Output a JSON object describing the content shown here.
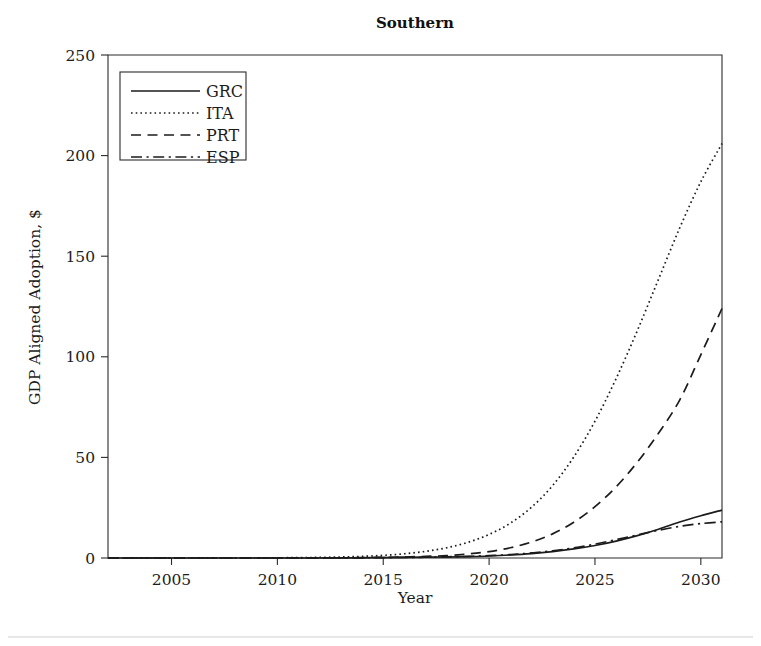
{
  "chart_data": {
    "type": "line",
    "title": "Southern",
    "xlabel": "Year",
    "ylabel": "GDP Aligned Adoption, $",
    "xlim": [
      2002,
      2031
    ],
    "ylim": [
      0,
      250
    ],
    "xticks": [
      2005,
      2010,
      2015,
      2020,
      2025,
      2030
    ],
    "yticks": [
      0,
      50,
      100,
      150,
      200,
      250
    ],
    "xtick_labels": [
      "2005",
      "2010",
      "2015",
      "2020",
      "2025",
      "2030"
    ],
    "ytick_labels": [
      "0",
      "50",
      "100",
      "150",
      "200",
      "250"
    ],
    "grid": false,
    "legend_position": "upper left",
    "x": [
      2002,
      2003,
      2004,
      2005,
      2006,
      2007,
      2008,
      2009,
      2010,
      2011,
      2012,
      2013,
      2014,
      2015,
      2016,
      2017,
      2018,
      2019,
      2020,
      2021,
      2022,
      2023,
      2024,
      2025,
      2026,
      2027,
      2028,
      2029,
      2030,
      2031
    ],
    "series": [
      {
        "name": "GRC",
        "style": "solid",
        "color": "#1b1b1b",
        "values": [
          0.0,
          0.0,
          0.0,
          0.0,
          0.0,
          0.0,
          0.0,
          0.0,
          0.0,
          0.0,
          0.0,
          0.1,
          0.1,
          0.2,
          0.3,
          0.4,
          0.5,
          0.7,
          1.0,
          1.5,
          2.2,
          3.2,
          4.5,
          6.2,
          8.4,
          11.1,
          14.3,
          17.9,
          21.0,
          23.8
        ]
      },
      {
        "name": "ITA",
        "style": "dotted",
        "color": "#1b1b1b",
        "values": [
          0.0,
          0.0,
          0.0,
          0.0,
          0.0,
          0.0,
          0.0,
          0.1,
          0.1,
          0.2,
          0.3,
          0.5,
          0.8,
          1.3,
          2.1,
          3.3,
          5.1,
          7.8,
          11.7,
          17.3,
          25.2,
          36.0,
          50.2,
          68.0,
          89.2,
          113.0,
          138.5,
          164.0,
          187.0,
          206.0
        ]
      },
      {
        "name": "PRT",
        "style": "dashed",
        "color": "#1b1b1b",
        "values": [
          0.0,
          0.0,
          0.0,
          0.0,
          0.0,
          0.0,
          0.0,
          0.0,
          0.0,
          0.0,
          0.1,
          0.1,
          0.2,
          0.3,
          0.5,
          0.8,
          1.2,
          2.0,
          3.2,
          5.1,
          7.9,
          12.0,
          17.8,
          25.5,
          35.4,
          47.6,
          62.0,
          78.5,
          101.0,
          124.0
        ]
      },
      {
        "name": "ESP",
        "style": "dashdot",
        "color": "#1b1b1b",
        "values": [
          0.0,
          0.0,
          0.0,
          0.0,
          0.0,
          0.0,
          0.0,
          0.0,
          0.0,
          0.0,
          0.0,
          0.1,
          0.1,
          0.2,
          0.3,
          0.4,
          0.6,
          0.8,
          1.2,
          1.7,
          2.5,
          3.6,
          5.0,
          6.9,
          9.1,
          11.5,
          13.8,
          15.7,
          17.1,
          18.0
        ]
      }
    ]
  },
  "legend": {
    "entries": [
      {
        "label": "GRC"
      },
      {
        "label": "ITA"
      },
      {
        "label": "PRT"
      },
      {
        "label": "ESP"
      }
    ]
  }
}
